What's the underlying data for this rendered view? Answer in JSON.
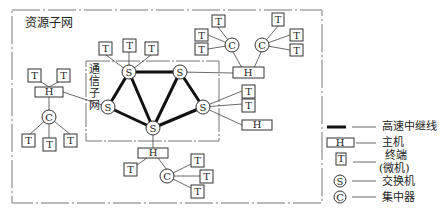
{
  "diagram": {
    "outer_label": "资源子网",
    "inner_label_chars": [
      "通",
      "信",
      "子",
      "网"
    ],
    "node_letters": {
      "terminal": "T",
      "host": "H",
      "switch": "S",
      "concentrator": "C"
    }
  },
  "legend": {
    "items": [
      {
        "symbol": "thick-line",
        "label": "高速中继线"
      },
      {
        "symbol": "host",
        "label": "主机"
      },
      {
        "symbol": "terminal",
        "label": "终端",
        "sublabel": "(微机)"
      },
      {
        "symbol": "switch",
        "label": "交换机"
      },
      {
        "symbol": "concentrator",
        "label": "集中器"
      }
    ]
  },
  "colors": {
    "line": "#333333",
    "dashed": "#888888",
    "background": "#ffffff"
  }
}
